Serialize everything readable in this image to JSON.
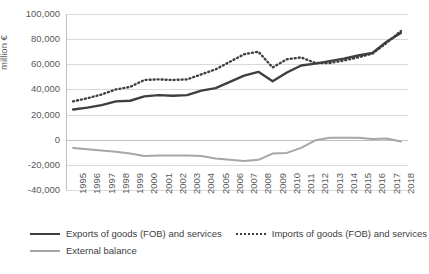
{
  "chart_data": {
    "type": "line",
    "title": "",
    "xlabel": "",
    "ylabel": "million €",
    "ylim": [
      -40000,
      100000
    ],
    "yticks": [
      "100,000",
      "80,000",
      "60,000",
      "40,000",
      "20,000",
      "0",
      "-20,000",
      "-40,000"
    ],
    "ytick_values": [
      100000,
      80000,
      60000,
      40000,
      20000,
      0,
      -20000,
      -40000
    ],
    "grid": true,
    "legend_position": "bottom-left",
    "categories": [
      "1995",
      "1996",
      "1997",
      "1998",
      "1999",
      "2000",
      "2001",
      "2002",
      "2003",
      "2004",
      "2005",
      "2006",
      "2007",
      "2008",
      "2009",
      "2010",
      "2011",
      "2012",
      "2013",
      "2014",
      "2015",
      "2016",
      "2017",
      "2018"
    ],
    "series": [
      {
        "name": "Exports of goods (FOB) and services",
        "style": "solid-dark",
        "values": [
          24000,
          25500,
          27500,
          30500,
          31000,
          34500,
          35500,
          35000,
          35500,
          39000,
          41000,
          46000,
          51000,
          54000,
          46500,
          53500,
          59000,
          60500,
          62500,
          64500,
          67000,
          69000,
          78000,
          85000
        ]
      },
      {
        "name": "Imports of goods (FOB) and services",
        "style": "dotted-dark",
        "values": [
          30500,
          33000,
          36000,
          40000,
          42000,
          47500,
          48000,
          47500,
          48000,
          52000,
          56000,
          62000,
          68000,
          70000,
          57500,
          64000,
          65500,
          61000,
          61000,
          63000,
          65500,
          68500,
          77000,
          86500
        ]
      },
      {
        "name": "External balance",
        "style": "solid-grey",
        "values": [
          -6500,
          -7500,
          -8500,
          -9500,
          -11000,
          -13000,
          -12500,
          -12500,
          -12500,
          -13000,
          -15000,
          -16000,
          -17000,
          -16000,
          -11000,
          -10500,
          -6500,
          -500,
          1500,
          1500,
          1500,
          500,
          1000,
          -1500
        ]
      }
    ]
  },
  "legend": {
    "items": [
      {
        "label": "Exports of goods (FOB) and services"
      },
      {
        "label": "Imports of goods (FOB) and services"
      },
      {
        "label": "External balance"
      }
    ]
  }
}
